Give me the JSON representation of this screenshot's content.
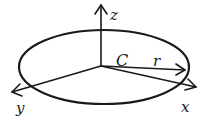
{
  "diagram": {
    "type": "3d-coordinate-circle",
    "labels": {
      "z_axis": "z",
      "x_axis": "x",
      "y_axis": "y",
      "curve": "C",
      "radius": "r"
    },
    "colors": {
      "ink": "#1a1a1a",
      "background": "#ffffff"
    }
  }
}
